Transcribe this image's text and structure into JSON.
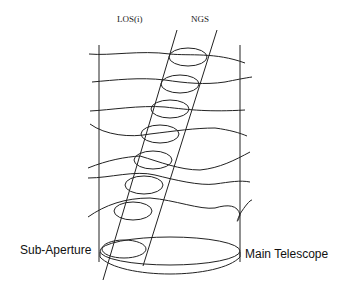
{
  "diagram": {
    "labels": {
      "los": "LOS(i)",
      "ngs": "NGS",
      "sub_aperture": "Sub-Aperture",
      "main_telescope": "Main Telescope"
    },
    "layers": 7,
    "colors": {
      "line": "#222222",
      "background": "#ffffff"
    }
  }
}
